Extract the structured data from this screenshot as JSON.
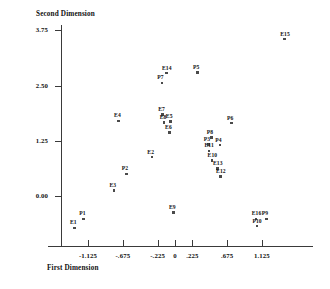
{
  "chart_data": {
    "type": "scatter",
    "title": "",
    "xlabel": "First Dimension",
    "ylabel": "Second Dimension",
    "xticks": [
      "-1.125",
      "-.675",
      "-.225",
      "0",
      ".225",
      ".675",
      "1.125"
    ],
    "xtick_values": [
      -1.125,
      -0.675,
      -0.225,
      0,
      0.225,
      0.675,
      1.125
    ],
    "yticks": [
      "3.75",
      "2.50",
      "1.25",
      "0.00"
    ],
    "ytick_values": [
      3.75,
      2.5,
      1.25,
      0.0
    ],
    "xlim": [
      -1.45,
      1.5
    ],
    "ylim": [
      -0.95,
      4.1
    ],
    "grid": false,
    "legend": "none",
    "points": [
      {
        "label": "E1",
        "x": -1.3,
        "y": -0.72
      },
      {
        "label": "P1",
        "x": -1.18,
        "y": -0.52
      },
      {
        "label": "E3",
        "x": -0.79,
        "y": 0.13
      },
      {
        "label": "P2",
        "x": -0.63,
        "y": 0.5
      },
      {
        "label": "E4",
        "x": -0.73,
        "y": 1.7
      },
      {
        "label": "E2",
        "x": -0.3,
        "y": 0.88
      },
      {
        "label": "E9",
        "x": -0.02,
        "y": -0.38
      },
      {
        "label": "E7",
        "x": -0.16,
        "y": 1.85
      },
      {
        "label": "E8",
        "x": -0.14,
        "y": 1.66
      },
      {
        "label": "E5",
        "x": -0.06,
        "y": 1.68
      },
      {
        "label": "E6",
        "x": -0.07,
        "y": 1.44
      },
      {
        "label": "P7",
        "x": -0.17,
        "y": 2.56
      },
      {
        "label": "E14",
        "x": -0.11,
        "y": 2.78
      },
      {
        "label": "P5",
        "x": 0.29,
        "y": 2.8
      },
      {
        "label": "P8",
        "x": 0.47,
        "y": 1.32
      },
      {
        "label": "P3",
        "x": 0.43,
        "y": 1.17
      },
      {
        "label": "P4",
        "x": 0.58,
        "y": 1.15
      },
      {
        "label": "E11",
        "x": 0.44,
        "y": 1.02
      },
      {
        "label": "E10",
        "x": 0.48,
        "y": 0.8
      },
      {
        "label": "E13",
        "x": 0.55,
        "y": 0.62
      },
      {
        "label": "E12",
        "x": 0.59,
        "y": 0.44
      },
      {
        "label": "P6",
        "x": 0.73,
        "y": 1.65
      },
      {
        "label": "E16",
        "x": 1.05,
        "y": -0.52
      },
      {
        "label": "P9",
        "x": 1.18,
        "y": -0.52
      },
      {
        "label": "P10",
        "x": 1.06,
        "y": -0.68
      },
      {
        "label": "E15",
        "x": 1.42,
        "y": 3.55
      }
    ]
  }
}
